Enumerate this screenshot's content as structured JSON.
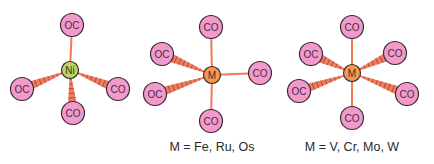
{
  "colors": {
    "background": "#ffffff",
    "ligand_fill": "#f29acb",
    "ligand_stroke": "#3a2a35",
    "ni_fill": "#b8d65a",
    "metal_fill": "#f29a48",
    "bond": "#f07a5a",
    "wedge_fill": "#f27b5e",
    "wedge_hash": "#7a3a2a",
    "text": "#2a2a2a"
  },
  "structures": [
    {
      "name": "nickel-tetracarbonyl",
      "center": {
        "label": "Ni",
        "x": 70,
        "y": 70,
        "r": 8.5,
        "fill_key": "ni_fill"
      },
      "ligands": [
        {
          "label": "OC",
          "x": 72,
          "y": 25,
          "bond": "plain"
        },
        {
          "label": "OC",
          "x": 22,
          "y": 89,
          "bond": "wedge"
        },
        {
          "label": "CO",
          "x": 118,
          "y": 89,
          "bond": "wedge"
        },
        {
          "label": "CO",
          "x": 73,
          "y": 113,
          "bond": "wedge"
        }
      ],
      "caption": ""
    },
    {
      "name": "pentacarbonyl",
      "center": {
        "label": "M",
        "x": 212,
        "y": 75,
        "r": 8.5,
        "fill_key": "metal_fill"
      },
      "ligands": [
        {
          "label": "CO",
          "x": 211,
          "y": 27,
          "bond": "plain"
        },
        {
          "label": "OC",
          "x": 162,
          "y": 54,
          "bond": "wedge"
        },
        {
          "label": "OC",
          "x": 155,
          "y": 94,
          "bond": "wedge"
        },
        {
          "label": "CO",
          "x": 260,
          "y": 73,
          "bond": "plain"
        },
        {
          "label": "CO",
          "x": 211,
          "y": 121,
          "bond": "plain"
        }
      ],
      "caption": "M = Fe, Ru, Os",
      "caption_x": 212,
      "caption_y": 151
    },
    {
      "name": "hexacarbonyl",
      "center": {
        "label": "M",
        "x": 352,
        "y": 73,
        "r": 8.5,
        "fill_key": "metal_fill"
      },
      "ligands": [
        {
          "label": "CO",
          "x": 352,
          "y": 27,
          "bond": "plain"
        },
        {
          "label": "OC",
          "x": 311,
          "y": 54,
          "bond": "wedge"
        },
        {
          "label": "CO",
          "x": 395,
          "y": 53,
          "bond": "wedge"
        },
        {
          "label": "OC",
          "x": 299,
          "y": 91,
          "bond": "wedge"
        },
        {
          "label": "CO",
          "x": 407,
          "y": 94,
          "bond": "wedge"
        },
        {
          "label": "CO",
          "x": 352,
          "y": 118,
          "bond": "plain"
        }
      ],
      "caption": "M = V, Cr, Mo, W",
      "caption_x": 352,
      "caption_y": 151
    }
  ]
}
